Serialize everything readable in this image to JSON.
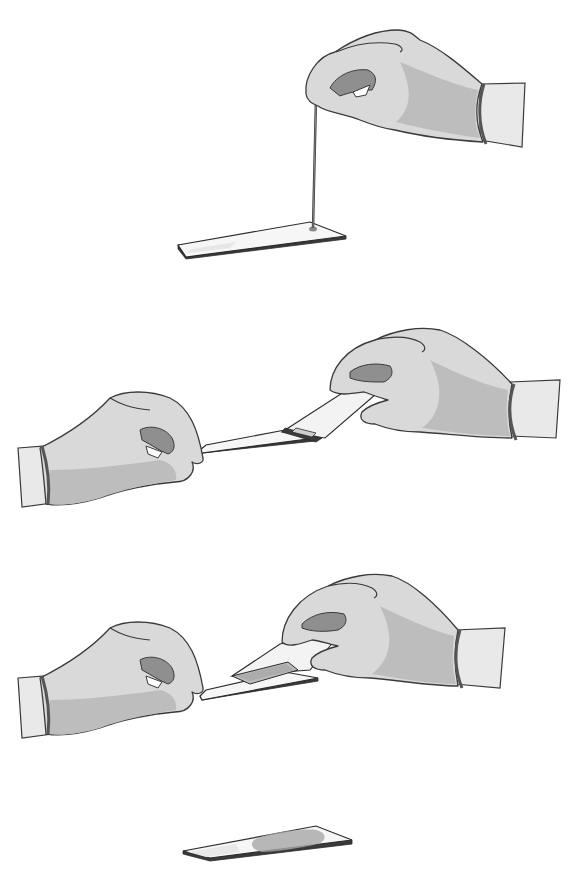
{
  "figure": {
    "title": "",
    "colors": {
      "background": "#ffffff",
      "glove": "#d9d9d9",
      "glove_shadow": "#bdbdbd",
      "outline": "#3a3a3a",
      "slide": "#f6f6f6",
      "smear": "#a8a8a8"
    },
    "steps": [
      {
        "index": 1,
        "label": "",
        "action": "Place a drop of blood on the slide using a capillary tube"
      },
      {
        "index": 2,
        "label": "",
        "action": "Hold the spreader slide at an angle and back it into the drop"
      },
      {
        "index": 3,
        "label": "",
        "action": "Push the spreader slide forward to spread the blood"
      },
      {
        "index": 4,
        "label": "",
        "action": "Finished blood smear on slide"
      }
    ]
  }
}
